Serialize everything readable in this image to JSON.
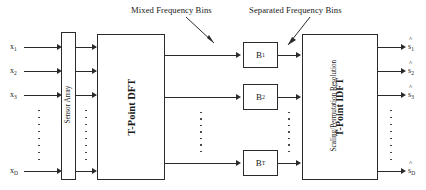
{
  "figure": {
    "annotations": [
      {
        "id": "mixed",
        "text": "Mixed Frequency Bins"
      },
      {
        "id": "separated",
        "text": "Separated Frequency Bins"
      }
    ]
  },
  "inputs": {
    "label_base": "x",
    "items": [
      {
        "base": "x",
        "sub": "1"
      },
      {
        "base": "x",
        "sub": "2"
      },
      {
        "base": "x",
        "sub": "3"
      },
      {
        "base": "x",
        "sub": "D"
      }
    ]
  },
  "outputs": {
    "label_base": "s",
    "accent": "^",
    "items": [
      {
        "base": "s",
        "sub": "1"
      },
      {
        "base": "s",
        "sub": "2"
      },
      {
        "base": "s",
        "sub": "3"
      },
      {
        "base": "s",
        "sub": "D"
      }
    ]
  },
  "blocks": {
    "sensor_array": {
      "caption": "Sensor Array"
    },
    "dft": {
      "caption": "T-Point DFT"
    },
    "bins": [
      {
        "base": "B",
        "sub": "1"
      },
      {
        "base": "B",
        "sub": "2"
      },
      {
        "base": "B",
        "sub": "T"
      }
    ],
    "output_stage": {
      "caption_primary": "T-Point IDFT",
      "caption_secondary": "Scaling/Permutation Resolution"
    }
  },
  "colors": {
    "stroke": "#2b2b2b",
    "background": "#ffffff",
    "text": "#1a1a1a"
  }
}
